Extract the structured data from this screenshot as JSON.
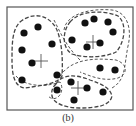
{
  "figure": {
    "caption": "(b)",
    "frame": {
      "x": 7,
      "y": 7,
      "width": 126,
      "height": 103,
      "stroke": "#555555"
    },
    "colors": {
      "dot": "#111111",
      "boundary": "#444444",
      "cross": "#555555"
    },
    "dot_radius": 3.6,
    "clusters": [
      {
        "name": "left",
        "centroid": [
          41,
          61
        ],
        "points": [
          [
            24,
            33
          ],
          [
            38,
            27
          ],
          [
            22,
            50
          ],
          [
            52,
            44
          ],
          [
            32,
            63
          ],
          [
            22,
            80
          ],
          [
            57,
            75
          ]
        ],
        "boundary": "M20,22 C32,12 48,14 56,28 C62,40 63,60 62,76 C58,84 40,86 24,88 C14,86 12,74 12,60 C12,44 12,30 20,22 Z",
        "dash": "4,2"
      },
      {
        "name": "top-right",
        "centroid": [
          93,
          42
        ],
        "points": [
          [
            85,
            23
          ],
          [
            94,
            19
          ],
          [
            108,
            22
          ],
          [
            113,
            32
          ],
          [
            72,
            40
          ],
          [
            87,
            47
          ],
          [
            100,
            43
          ]
        ],
        "boundary": "M70,22 C80,10 104,10 118,16 C128,24 124,44 116,52 C104,58 84,58 72,54 C62,48 62,32 70,22 Z",
        "dash": "4,2"
      },
      {
        "name": "bottom-right",
        "centroid": [
          78,
          88
        ],
        "points": [
          [
            100,
            68
          ],
          [
            115,
            70
          ],
          [
            57,
            90
          ],
          [
            71,
            82
          ],
          [
            87,
            88
          ],
          [
            103,
            92
          ],
          [
            74,
            100
          ]
        ],
        "boundary": "M56,84 C62,74 76,74 90,80 C102,84 110,88 112,96 C110,106 96,108 80,108 C66,108 54,104 52,96 C51,90 53,87 56,84 Z",
        "dash": "4,2"
      }
    ],
    "secondary_boundaries": [
      {
        "name": "outer-top-right",
        "path": "M64,30 C66,14 90,8 112,10 C128,12 132,30 128,46 C124,66 126,80 112,88",
        "dash": "3,2"
      },
      {
        "name": "middle-right",
        "path": "M60,76 C72,58 96,58 116,60 C128,64 128,74 118,78 C104,82 90,76 80,72",
        "dash": "3,2"
      },
      {
        "name": "cross-left",
        "path": "M54,20 C60,32 66,46 80,60",
        "dash": "3,2"
      },
      {
        "name": "bottom-left-loop",
        "path": "M16,76 C24,86 44,88 60,82 C66,92 56,104 48,96",
        "dash": "3,2"
      }
    ]
  }
}
